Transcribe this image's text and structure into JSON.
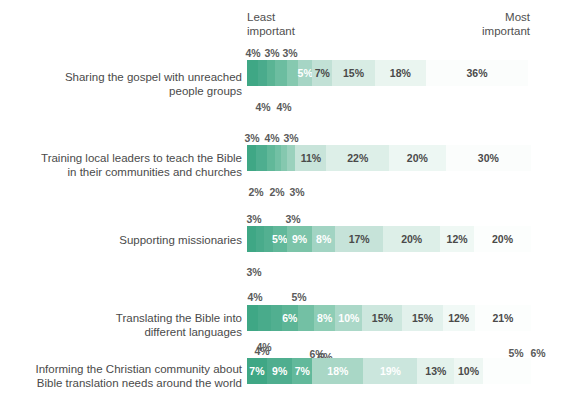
{
  "axis": {
    "least_label": "Least\nimportant",
    "most_label": "Most\nimportant"
  },
  "colors": {
    "ramp": [
      "#3fa785",
      "#56b193",
      "#6dbca1",
      "#87c8b1",
      "#a3d4c3",
      "#bfe0d4",
      "#d4e9e0",
      "#e3f1ec",
      "#eef7f3",
      "#f6fbf9"
    ],
    "dark_text": "#4a4a4a",
    "light_text": "#ffffff"
  },
  "chart_data": {
    "type": "bar",
    "subtype": "stacked-horizontal-likert",
    "title": "",
    "xlabel": "",
    "ylabel": "",
    "xlim": [
      0,
      100
    ],
    "grid": false,
    "legend": "none",
    "axis_labels": {
      "left": "Least important",
      "right": "Most important"
    },
    "categories": [
      "Sharing the gospel with unreached people groups",
      "Training local leaders to teach the Bible in their communities and churches",
      "Supporting missionaries",
      "Translating the Bible into different languages",
      "Informing the Christian community about Bible translation needs around the world"
    ],
    "rows": [
      {
        "label": "Sharing the gospel with unreached\npeople groups",
        "values": [
          4,
          3,
          3,
          4,
          4,
          5,
          7,
          15,
          18,
          36
        ],
        "labels": [
          "4%",
          "3%",
          "3%",
          "4%",
          "4%",
          "5%",
          "7%",
          "15%",
          "18%",
          "36%"
        ],
        "placements": [
          "above",
          "above",
          "above",
          "below",
          "below",
          "in",
          "in",
          "in",
          "in",
          "in"
        ]
      },
      {
        "label": "Training local leaders to teach the Bible\nin their communities and churches",
        "values": [
          3,
          4,
          3,
          2,
          2,
          3,
          11,
          22,
          20,
          30
        ],
        "labels": [
          "3%",
          "4%",
          "3%",
          "2%",
          "2%",
          "3%",
          "11%",
          "22%",
          "20%",
          "30%"
        ],
        "placements": [
          "above",
          "above",
          "above",
          "below",
          "below",
          "below",
          "in",
          "in",
          "in",
          "in"
        ]
      },
      {
        "label": "Supporting missionaries",
        "values": [
          3,
          3,
          3,
          5,
          9,
          8,
          17,
          20,
          12,
          20
        ],
        "labels": [
          "3%",
          "3%",
          "3%",
          "5%",
          "9%",
          "8%",
          "17%",
          "20%",
          "12%",
          "20%"
        ],
        "placements": [
          "above",
          "above",
          "below",
          "in",
          "in",
          "in",
          "in",
          "in",
          "in",
          "in"
        ]
      },
      {
        "label": "Translating the Bible into\ndifferent languages",
        "values": [
          4,
          5,
          4,
          6,
          6,
          8,
          10,
          15,
          15,
          12,
          21
        ],
        "labels": [
          "4%",
          "5%",
          "4%",
          "6%",
          "6%",
          "8%",
          "10%",
          "15%",
          "15%",
          "12%",
          "21%"
        ],
        "placements": [
          "above",
          "above",
          "below",
          "below",
          "in",
          "in",
          "in",
          "in",
          "in",
          "in",
          "in"
        ]
      },
      {
        "label": "Informing the Christian community about\nBible translation needs around the world",
        "values": [
          4,
          6,
          5,
          6,
          7,
          9,
          7,
          18,
          19,
          13,
          10
        ],
        "labels": [
          "4%",
          "6%",
          "5%",
          "6%",
          "7%",
          "9%",
          "7%",
          "18%",
          "19%",
          "13%",
          "10%"
        ],
        "placements": [
          "above",
          "above",
          "above",
          "above",
          "in",
          "in",
          "in",
          "in",
          "in",
          "in",
          "in"
        ]
      }
    ]
  },
  "render": {
    "rows": [
      {
        "top": 60,
        "label_top": 70,
        "label": "Sharing the gospel with unreached\npeople groups",
        "segments": [
          {
            "w": 4,
            "label": "4%",
            "place": "none",
            "color": "#3fa785"
          },
          {
            "w": 3,
            "label": "3%",
            "place": "none",
            "color": "#4aab8c"
          },
          {
            "w": 3,
            "label": "3%",
            "place": "none",
            "color": "#5ab494"
          },
          {
            "w": 4,
            "label": "4%",
            "place": "none",
            "color": "#6cbda0"
          },
          {
            "w": 4,
            "label": "4%",
            "place": "none",
            "color": "#86c9b0"
          },
          {
            "w": 5,
            "label": "5%",
            "place": "in",
            "color": "#a6d5c5",
            "tc": "#ffffff"
          },
          {
            "w": 7,
            "label": "7%",
            "place": "in",
            "color": "#c2e1d6",
            "tc": "#4a4a4a"
          },
          {
            "w": 15,
            "label": "15%",
            "place": "in",
            "color": "#d8ece4",
            "tc": "#4a4a4a"
          },
          {
            "w": 18,
            "label": "18%",
            "place": "in",
            "color": "#eaf5f0",
            "tc": "#4a4a4a"
          },
          {
            "w": 36,
            "label": "36%",
            "place": "in",
            "color": "#fbfdfc",
            "tc": "#4a4a4a"
          }
        ],
        "callouts": [
          {
            "text": "4%",
            "x": 253,
            "y": 47,
            "pos": "above"
          },
          {
            "text": "3%",
            "x": 272,
            "y": 47,
            "pos": "above"
          },
          {
            "text": "3%",
            "x": 290,
            "y": 47,
            "pos": "above"
          },
          {
            "text": "4%",
            "x": 263,
            "y": 101,
            "pos": "below"
          },
          {
            "text": "4%",
            "x": 284,
            "y": 101,
            "pos": "below"
          }
        ]
      },
      {
        "top": 145,
        "label_top": 151,
        "label": "Training local leaders to teach the Bible\nin their communities and churches",
        "segments": [
          {
            "w": 3,
            "label": "3%",
            "place": "none",
            "color": "#3fa785"
          },
          {
            "w": 4,
            "label": "4%",
            "place": "none",
            "color": "#4eae8f"
          },
          {
            "w": 3,
            "label": "3%",
            "place": "none",
            "color": "#61b899"
          },
          {
            "w": 2,
            "label": "2%",
            "place": "none",
            "color": "#72c0a4"
          },
          {
            "w": 2,
            "label": "2%",
            "place": "none",
            "color": "#85c8af"
          },
          {
            "w": 3,
            "label": "3%",
            "place": "none",
            "color": "#9bd1bd"
          },
          {
            "w": 11,
            "label": "11%",
            "place": "in",
            "color": "#c8e4da",
            "tc": "#4a4a4a"
          },
          {
            "w": 22,
            "label": "22%",
            "place": "in",
            "color": "#ddefe8",
            "tc": "#4a4a4a"
          },
          {
            "w": 20,
            "label": "20%",
            "place": "in",
            "color": "#edf7f3",
            "tc": "#4a4a4a"
          },
          {
            "w": 30,
            "label": "30%",
            "place": "in",
            "color": "#fbfdfc",
            "tc": "#4a4a4a"
          }
        ],
        "callouts": [
          {
            "text": "3%",
            "x": 252,
            "y": 132,
            "pos": "above"
          },
          {
            "text": "4%",
            "x": 272,
            "y": 132,
            "pos": "above"
          },
          {
            "text": "3%",
            "x": 291,
            "y": 132,
            "pos": "above"
          },
          {
            "text": "2%",
            "x": 256,
            "y": 186,
            "pos": "below"
          },
          {
            "text": "2%",
            "x": 277,
            "y": 186,
            "pos": "below"
          },
          {
            "text": "3%",
            "x": 297,
            "y": 186,
            "pos": "below"
          }
        ]
      },
      {
        "top": 226,
        "label_top": 233,
        "label": "Supporting missionaries",
        "segments": [
          {
            "w": 3,
            "label": "3%",
            "place": "none",
            "color": "#3fa785"
          },
          {
            "w": 3,
            "label": "3%",
            "place": "none",
            "color": "#49ab8b"
          },
          {
            "w": 3,
            "label": "3%",
            "place": "none",
            "color": "#53b091"
          },
          {
            "w": 5,
            "label": "5%",
            "place": "in",
            "color": "#61b89a",
            "tc": "#ffffff"
          },
          {
            "w": 9,
            "label": "9%",
            "place": "in",
            "color": "#7cc4a9",
            "tc": "#ffffff"
          },
          {
            "w": 8,
            "label": "8%",
            "place": "in",
            "color": "#a2d4c3",
            "tc": "#ffffff"
          },
          {
            "w": 17,
            "label": "17%",
            "place": "in",
            "color": "#c6e3d9",
            "tc": "#4a4a4a"
          },
          {
            "w": 20,
            "label": "20%",
            "place": "in",
            "color": "#ddefe8",
            "tc": "#4a4a4a"
          },
          {
            "w": 12,
            "label": "12%",
            "place": "in",
            "color": "#eff8f4",
            "tc": "#4a4a4a"
          },
          {
            "w": 20,
            "label": "20%",
            "place": "in",
            "color": "#fcfefd",
            "tc": "#4a4a4a"
          }
        ],
        "callouts": [
          {
            "text": "3%",
            "x": 254,
            "y": 213,
            "pos": "above"
          },
          {
            "text": "3%",
            "x": 293,
            "y": 213,
            "pos": "above"
          },
          {
            "text": "3%",
            "x": 254,
            "y": 266,
            "pos": "below"
          }
        ]
      },
      {
        "top": 305,
        "label_top": 311,
        "label": "Translating the Bible into\ndifferent languages",
        "segments": [
          {
            "w": 4,
            "label": "4%",
            "place": "none",
            "color": "#3fa785"
          },
          {
            "w": 5,
            "label": "5%",
            "place": "none",
            "color": "#49ab8b"
          },
          {
            "w": 4,
            "label": "4%",
            "place": "none",
            "color": "#51af90"
          },
          {
            "w": 6,
            "label": "6%",
            "place": "in",
            "color": "#5cb596",
            "tc": "#ffffff"
          },
          {
            "w": 6,
            "label": "6%",
            "place": "none",
            "color": "#73c0a4"
          },
          {
            "w": 8,
            "label": "8%",
            "place": "in",
            "color": "#8ecdb5",
            "tc": "#ffffff"
          },
          {
            "w": 10,
            "label": "10%",
            "place": "in",
            "color": "#abd8c8",
            "tc": "#ffffff"
          },
          {
            "w": 15,
            "label": "15%",
            "place": "in",
            "color": "#cde7de",
            "tc": "#4a4a4a"
          },
          {
            "w": 15,
            "label": "15%",
            "place": "in",
            "color": "#e2f1ec",
            "tc": "#4a4a4a"
          },
          {
            "w": 12,
            "label": "12%",
            "place": "in",
            "color": "#f1f9f6",
            "tc": "#4a4a4a"
          },
          {
            "w": 21,
            "label": "21%",
            "place": "in",
            "color": "#fcfefd",
            "tc": "#4a4a4a"
          }
        ],
        "callouts": [
          {
            "text": "4%",
            "x": 255,
            "y": 291,
            "pos": "above"
          },
          {
            "text": "5%",
            "x": 299,
            "y": 291,
            "pos": "above"
          },
          {
            "text": "4%",
            "x": 262,
            "y": 345,
            "pos": "below"
          },
          {
            "text": "6%",
            "x": 325,
            "y": 351,
            "pos": "below"
          }
        ]
      },
      {
        "top": 358,
        "label_top": 362,
        "label": "Informing the Christian community about\nBible translation needs around the world",
        "segments": [
          {
            "w": 7,
            "label": "7%",
            "place": "in",
            "color": "#3fa785",
            "tc": "#ffffff"
          },
          {
            "w": 9,
            "label": "9%",
            "place": "in",
            "color": "#4fae8f",
            "tc": "#ffffff"
          },
          {
            "w": 7,
            "label": "7%",
            "place": "in",
            "color": "#62b99b",
            "tc": "#ffffff"
          },
          {
            "w": 18,
            "label": "18%",
            "place": "in",
            "color": "#a9d7c6",
            "tc": "#ffffff"
          },
          {
            "w": 19,
            "label": "19%",
            "place": "in",
            "color": "#cbe6dd",
            "tc": "#ffffff"
          },
          {
            "w": 13,
            "label": "13%",
            "place": "in",
            "color": "#e3f2ec",
            "tc": "#4a4a4a"
          },
          {
            "w": 10,
            "label": "10%",
            "place": "in",
            "color": "#eef7f3",
            "tc": "#4a4a4a"
          },
          {
            "w": 17,
            "label": "",
            "place": "none",
            "color": "#fcfefd"
          }
        ],
        "callouts": [
          {
            "text": "4%",
            "x": 264,
            "y": 341,
            "pos": "above"
          },
          {
            "text": "6%",
            "x": 317,
            "y": 348,
            "pos": "above"
          },
          {
            "text": "5%",
            "x": 516,
            "y": 347,
            "pos": "above"
          },
          {
            "text": "6%",
            "x": 538,
            "y": 347,
            "pos": "above"
          }
        ]
      }
    ]
  }
}
